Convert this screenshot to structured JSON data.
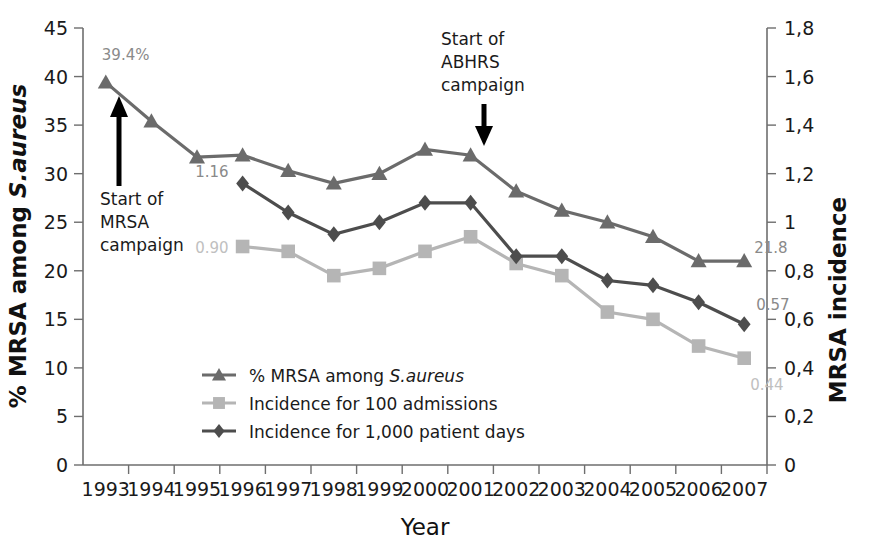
{
  "chart_data": {
    "type": "line",
    "title": "",
    "xlabel": "Year",
    "ylabel": "% MRSA among S.aureus",
    "y2label": "MRSA incidence",
    "categories": [
      "1993",
      "1994",
      "1995",
      "1996",
      "1997",
      "1998",
      "1999",
      "2000",
      "2001",
      "2002",
      "2003",
      "2004",
      "2005",
      "2006",
      "2007"
    ],
    "ylim": [
      0,
      45
    ],
    "y2lim": [
      0,
      1.8
    ],
    "yticks": [
      "0",
      "5",
      "10",
      "15",
      "20",
      "25",
      "30",
      "35",
      "40",
      "45"
    ],
    "y2ticks": [
      "0",
      "0,2",
      "0,4",
      "0,6",
      "0,8",
      "1",
      "1,2",
      "1,4",
      "1,6",
      "1,8"
    ],
    "grid": false,
    "legend_position": "inside-lower-center",
    "series": [
      {
        "name": "% MRSA among S.aureus",
        "name_prefix": "% MRSA among ",
        "name_italic": "S.aureus",
        "marker": "triangle",
        "color": "#6b6b6b",
        "axis": "left",
        "values": [
          39.4,
          35.4,
          31.7,
          31.9,
          30.3,
          29.0,
          30.0,
          32.5,
          31.9,
          28.2,
          26.2,
          25.0,
          23.5,
          21.0,
          21.0
        ]
      },
      {
        "name": "Incidence for 100 admissions",
        "name_prefix": "Incidence for 100 admissions",
        "name_italic": "",
        "marker": "square",
        "color": "#b5b5b5",
        "axis": "right",
        "values": [
          null,
          null,
          null,
          0.9,
          0.88,
          0.78,
          0.81,
          0.88,
          0.94,
          0.83,
          0.78,
          0.63,
          0.6,
          0.49,
          0.44
        ]
      },
      {
        "name": "Incidence for 1,000 patient days",
        "name_prefix": "Incidence for 1,000 patient days",
        "name_italic": "",
        "marker": "diamond",
        "color": "#4d4d4d",
        "axis": "right",
        "values": [
          null,
          null,
          null,
          1.16,
          1.04,
          0.95,
          1.0,
          1.08,
          1.08,
          0.86,
          0.86,
          0.76,
          0.74,
          0.67,
          0.58
        ]
      }
    ],
    "point_labels": [
      {
        "text": "39.4%",
        "series": 0,
        "index": 0,
        "color": "#8a8a8a"
      },
      {
        "text": "21.8",
        "series": 0,
        "index": 14,
        "color": "#8a8a8a"
      },
      {
        "text": "1.16",
        "series": 2,
        "index": 3,
        "color": "#8a8a8a"
      },
      {
        "text": "0.57",
        "series": 2,
        "index": 14,
        "color": "#8a8a8a"
      },
      {
        "text": "0.90",
        "series": 1,
        "index": 3,
        "color": "#c0c0c0"
      },
      {
        "text": "0.44",
        "series": 1,
        "index": 14,
        "color": "#c0c0c0"
      }
    ],
    "annotations": [
      {
        "name": "mrsa-campaign",
        "lines": [
          "Start of",
          "MRSA",
          "campaign"
        ],
        "arrow": "up",
        "at_year": "1993"
      },
      {
        "name": "abhrs-campaign",
        "lines": [
          "Start of",
          "ABHRS",
          "campaign"
        ],
        "arrow": "down",
        "at_year": "2001"
      }
    ]
  }
}
